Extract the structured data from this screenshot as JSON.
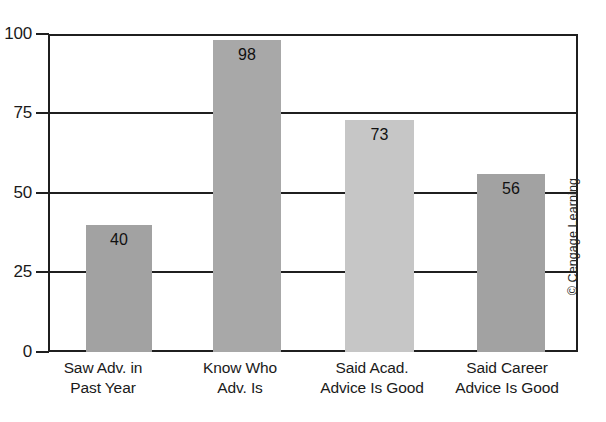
{
  "chart_data": {
    "type": "bar",
    "title": "",
    "subtitle": "",
    "xlabel": "",
    "ylabel": "",
    "ylim": [
      0,
      100
    ],
    "yticks": [
      0,
      25,
      50,
      75,
      100
    ],
    "grid": true,
    "legend": false,
    "legend_position": "none",
    "categories": [
      "Saw Adv. in Past Year",
      "Know Who Adv. Is",
      "Said Acad. Advice Is Good",
      "Said Career Advice Is Good"
    ],
    "values": [
      40,
      98,
      73,
      56
    ],
    "bar_colors": [
      "#a2a2a2",
      "#a8a8a8",
      "#c6c6c6",
      "#a2a2a2"
    ],
    "data_labels": [
      "40",
      "98",
      "73",
      "56"
    ]
  },
  "axis": {
    "y_tick_labels": [
      "100",
      "75",
      "50",
      "25",
      "0"
    ],
    "x_tick_labels": [
      {
        "line1": "Saw Adv. in",
        "line2": "Past Year"
      },
      {
        "line1": "Know Who",
        "line2": "Adv. Is"
      },
      {
        "line1": "Said Acad.",
        "line2": "Advice Is Good"
      },
      {
        "line1": "Said Career",
        "line2": "Advice Is Good"
      }
    ]
  },
  "credit": {
    "text": "© Cengage Learning"
  },
  "colors": {
    "axis": "#1f1f1f",
    "background": "#ffffff",
    "text": "#1a1a1a"
  }
}
